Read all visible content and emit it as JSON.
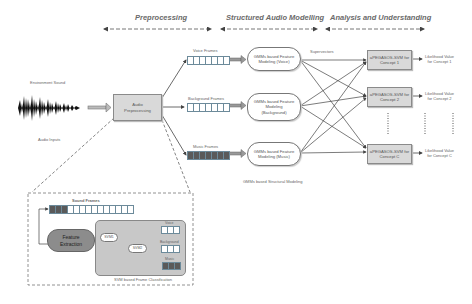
{
  "stages": {
    "preprocessing": "Preprocessing",
    "structured": "Structured Audio Modelling",
    "analysis": "Analysis and Understanding"
  },
  "inputs": {
    "environment_sound": "Environment Sound",
    "audio_inputs": "Audio Inputs"
  },
  "preprocessing_box": {
    "line1": "Audio",
    "line2": "Preprocessing"
  },
  "frames": {
    "voice": "Voice Frames",
    "background": "Background Frames",
    "music": "Music Frames"
  },
  "gmm": {
    "voice": {
      "line1": "GMMs based Feature",
      "line2": "Modeling (Voice)"
    },
    "background": {
      "line1": "GMMs based Feature",
      "line2": "Modeling",
      "line3": "(Background)"
    },
    "music": {
      "line1": "GMMs based Feature",
      "line2": "Modeling (Music)"
    },
    "caption": "GMMs based Structural Modeling"
  },
  "supervectors_label": "Supervectors",
  "svm": {
    "c1": {
      "line1": "aPEGASOS-SVM for",
      "line2": "Concept 1"
    },
    "c2": {
      "line1": "aPEGASOS-SVM for",
      "line2": "Concept 2"
    },
    "cc": {
      "line1": "aPEGASOS-SVM for",
      "line2": "Concept C"
    }
  },
  "outputs": {
    "c1": {
      "line1": "Likelihood Value",
      "line2": "for Concept 1"
    },
    "c2": {
      "line1": "Likelihood Value",
      "line2": "for Concept 2"
    },
    "cc": {
      "line1": "Likelihood Value",
      "line2": "for Concept C"
    }
  },
  "detail": {
    "sound_frames": "Sound Frames",
    "feature_extraction": {
      "line1": "Feature",
      "line2": "Extraction"
    },
    "svm1": "SVM1",
    "svm2": "SVM2",
    "out_voice": "Voice",
    "out_background": "Background",
    "out_music": "Music",
    "caption": "SVM based Frame Classification"
  },
  "colors": {
    "grey_box": "#d9d9d9",
    "feature_extraction": "#8c8c8c",
    "classification_panel": "#c8c8c8",
    "frame_border": "#6c8a9a",
    "dark_frame": "#5a5a5a"
  }
}
